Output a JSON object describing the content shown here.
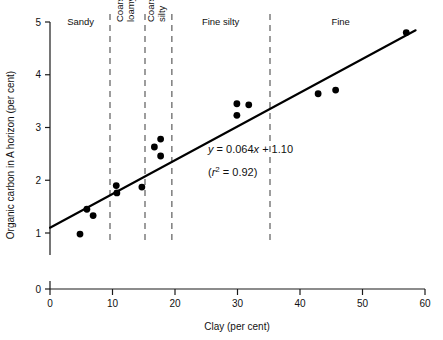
{
  "chart_data": {
    "type": "scatter",
    "title": "",
    "xlabel": "Clay (per cent)",
    "ylabel": "Organic carbon in A horizon (per cent)",
    "xlim": [
      0,
      60
    ],
    "ylim": [
      0,
      5
    ],
    "xticks": [
      0,
      10,
      20,
      30,
      40,
      50,
      60
    ],
    "yticks": [
      0,
      1,
      2,
      3,
      4,
      5
    ],
    "xtick_labels": [
      "0",
      "10",
      "20",
      "30",
      "40",
      "50",
      "60"
    ],
    "ytick_labels": [
      "0",
      "1",
      "2",
      "3",
      "4",
      "5"
    ],
    "grid": false,
    "legend": "none",
    "points": [
      {
        "x": 4.8,
        "y": 0.98
      },
      {
        "x": 5.9,
        "y": 1.45
      },
      {
        "x": 6.9,
        "y": 1.33
      },
      {
        "x": 10.6,
        "y": 1.9
      },
      {
        "x": 10.7,
        "y": 1.76
      },
      {
        "x": 14.7,
        "y": 1.87
      },
      {
        "x": 16.7,
        "y": 2.63
      },
      {
        "x": 17.7,
        "y": 2.78
      },
      {
        "x": 17.7,
        "y": 2.46
      },
      {
        "x": 29.9,
        "y": 3.45
      },
      {
        "x": 29.9,
        "y": 3.23
      },
      {
        "x": 31.8,
        "y": 3.43
      },
      {
        "x": 42.9,
        "y": 3.64
      },
      {
        "x": 45.7,
        "y": 3.71
      },
      {
        "x": 57.0,
        "y": 4.8
      }
    ],
    "fit_line": {
      "slope": 0.064,
      "intercept": 1.1,
      "x_start": 0,
      "x_end": 58.5
    },
    "annotations": {
      "equation_y": "y",
      "equation_rest": " = 0.064",
      "equation_x": "x",
      "equation_tail": " + 1.10",
      "r2_open": "(",
      "r2_r": "r",
      "r2_sup": "2",
      "r2_rest": " = 0.92)"
    },
    "dividers": [
      9.6,
      15.2,
      19.5,
      35.2
    ],
    "regions": [
      {
        "label": "Sandy",
        "center_x": 4.9,
        "rotated": false
      },
      {
        "label": "Coarse loamy",
        "center_x": 12.4,
        "rotated": true,
        "line1": "Coarse",
        "line2": "loamy"
      },
      {
        "label": "Coarse silty",
        "center_x": 17.4,
        "rotated": true,
        "line1": "Coarse",
        "line2": "silty"
      },
      {
        "label": "Fine silty",
        "center_x": 27.3,
        "rotated": false
      },
      {
        "label": "Fine",
        "center_x": 46.5,
        "rotated": false
      }
    ],
    "colors": {
      "point": "#000000",
      "fit_line": "#000000",
      "divider": "#4d4d4d",
      "axis": "#1a1a1a",
      "background": "#ffffff"
    }
  }
}
